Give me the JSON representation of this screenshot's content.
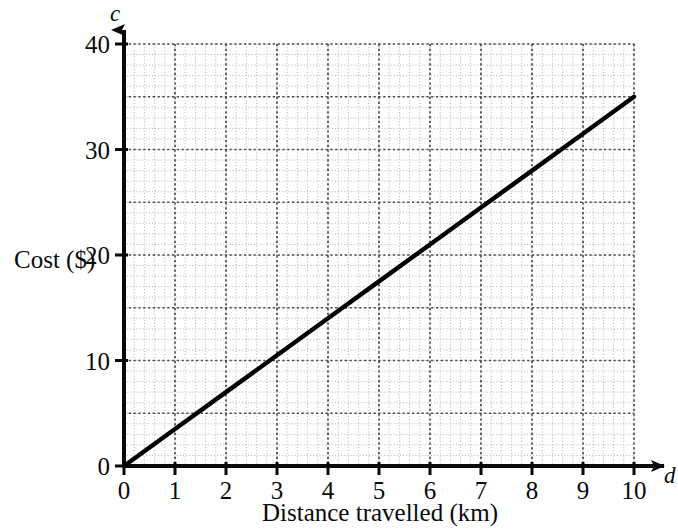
{
  "chart_data": {
    "type": "line",
    "title": "",
    "subtitle": "",
    "xlabel": "Distance travelled (km)",
    "ylabel": "Cost ($)",
    "x_variable": "d",
    "y_variable": "c",
    "xlim": [
      0,
      10
    ],
    "ylim": [
      0,
      40
    ],
    "x_ticks": [
      0,
      1,
      2,
      3,
      4,
      5,
      6,
      7,
      8,
      9,
      10
    ],
    "x_tick_labels": [
      "0",
      "1",
      "2",
      "3",
      "4",
      "5",
      "6",
      "7",
      "8",
      "9",
      "10"
    ],
    "y_ticks": [
      0,
      10,
      20,
      30,
      40
    ],
    "y_tick_labels": [
      "0",
      "10",
      "20",
      "30",
      "40"
    ],
    "grid": true,
    "grid_style": "dotted graph paper",
    "x_major_step": 1,
    "x_minor_step": 0.2,
    "y_major_step": 5,
    "y_minor_step": 1,
    "legend": false,
    "legend_position": "none",
    "annotations": [],
    "series": [
      {
        "name": "Cost versus distance",
        "type": "line",
        "color": "#000000",
        "slope": 3.5,
        "intercept": 0,
        "x": [
          0,
          1,
          2,
          3,
          4,
          5,
          6,
          7,
          8,
          9,
          10
        ],
        "values": [
          0,
          3.5,
          7,
          10.5,
          14,
          17.5,
          21,
          24.5,
          28,
          31.5,
          35
        ],
        "endpoints": [
          [
            0,
            0
          ],
          [
            10,
            35
          ]
        ]
      }
    ]
  },
  "colors": {
    "line": "#000000",
    "axis": "#0a0a0a",
    "grid_major": "#4a4a4a",
    "grid_minor": "#b8b8b8",
    "background": "#ffffff",
    "text": "#0a0a0a"
  },
  "axes": {
    "x": {
      "title": "Distance travelled (km)",
      "variable": "d",
      "ticks": [
        "0",
        "1",
        "2",
        "3",
        "4",
        "5",
        "6",
        "7",
        "8",
        "9",
        "10"
      ]
    },
    "y": {
      "title": "Cost ($)",
      "variable": "c",
      "ticks": [
        "0",
        "10",
        "20",
        "30",
        "40"
      ]
    }
  }
}
